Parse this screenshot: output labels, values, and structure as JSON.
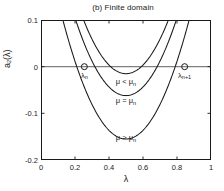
{
  "chart_data": {
    "type": "line",
    "title": "(b) Finite domain",
    "xlabel": "λ",
    "ylabel": "a₂(λ)",
    "xlim": [
      0,
      1
    ],
    "ylim": [
      -0.2,
      0.1
    ],
    "grid": false,
    "legend_position": "inline-annotations",
    "xticks": [
      "0",
      "0.2",
      "0.4",
      "0.6",
      "0.8",
      "1"
    ],
    "xtick_values": [
      0,
      0.2,
      0.4,
      0.6,
      0.8,
      1
    ],
    "yticks": [
      "0.1",
      "0",
      "-0.1",
      "-0.2"
    ],
    "ytick_values": [
      0.1,
      0,
      -0.1,
      -0.2
    ],
    "reference_lines": [
      {
        "name": "zero-line",
        "orientation": "horizontal",
        "value": 0
      }
    ],
    "series": [
      {
        "name": "μ < μₙ",
        "label": "μ < μₙ",
        "label_text": "μ < μ",
        "label_sub": "n",
        "vertex_x": 0.5,
        "vertex_y": -0.015,
        "curvature": 1.85,
        "x": [
          0.0,
          0.1,
          0.2,
          0.3,
          0.4,
          0.5,
          0.6,
          0.7,
          0.8,
          0.9,
          1.0
        ],
        "values": [
          0.447,
          0.281,
          0.152,
          0.059,
          0.003,
          -0.015,
          0.003,
          0.059,
          0.152,
          0.281,
          0.447
        ]
      },
      {
        "name": "μ = μₙ",
        "label": "μ = μₙ",
        "label_text": "μ = μ",
        "label_sub": "n",
        "vertex_x": 0.5,
        "vertex_y": -0.062,
        "curvature": 1.85,
        "x": [
          0.0,
          0.1,
          0.2,
          0.3,
          0.4,
          0.5,
          0.6,
          0.7,
          0.8,
          0.9,
          1.0
        ],
        "values": [
          0.4,
          0.234,
          0.105,
          0.012,
          -0.044,
          -0.062,
          -0.044,
          0.012,
          0.105,
          0.234,
          0.4
        ]
      },
      {
        "name": "μ > μₙ",
        "label": "μ > μₙ",
        "label_text": "μ > μ",
        "label_sub": "n",
        "vertex_x": 0.5,
        "vertex_y": -0.155,
        "curvature": 1.85,
        "x": [
          0.0,
          0.1,
          0.2,
          0.3,
          0.4,
          0.5,
          0.6,
          0.7,
          0.8,
          0.9,
          1.0
        ],
        "values": [
          0.307,
          0.141,
          0.012,
          -0.081,
          -0.137,
          -0.155,
          -0.137,
          -0.081,
          0.012,
          0.141,
          0.307
        ]
      }
    ],
    "markers": [
      {
        "name": "root-lambda-n",
        "shape": "circle-open",
        "x": 0.255,
        "y": 0,
        "label_text": "λ",
        "label_sub": "n"
      },
      {
        "name": "root-lambda-n-plus-1",
        "shape": "circle-open",
        "x": 0.845,
        "y": 0,
        "label_text": "λ",
        "label_sub": "n+1"
      }
    ],
    "annotations": [
      {
        "name": "region-label-mu-less",
        "text": "μ < μₙ",
        "x": 0.5,
        "y": -0.032
      },
      {
        "name": "region-label-mu-equal",
        "text": "μ = μₙ",
        "x": 0.5,
        "y": -0.073
      },
      {
        "name": "region-label-mu-greater",
        "text": "μ > μₙ",
        "x": 0.5,
        "y": -0.152
      }
    ],
    "colors": {
      "curve": "#1a1a1a",
      "axis": "#1a1a1a",
      "zero_line": "#808080",
      "background": "#ffffff",
      "text": "#1a1a1a"
    }
  }
}
